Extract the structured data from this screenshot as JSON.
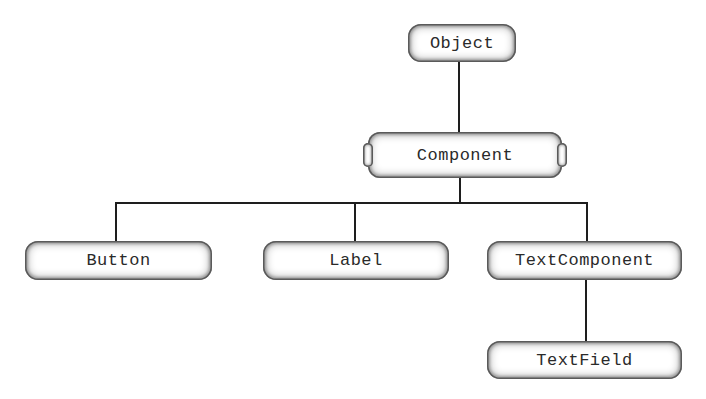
{
  "diagram": {
    "type": "class-hierarchy",
    "nodes": {
      "object": {
        "label": "Object",
        "abstract": false
      },
      "component": {
        "label": "Component",
        "abstract": true
      },
      "button": {
        "label": "Button",
        "abstract": false
      },
      "label": {
        "label": "Label",
        "abstract": false
      },
      "text_component": {
        "label": "TextComponent",
        "abstract": false
      },
      "text_field": {
        "label": "TextField",
        "abstract": false
      }
    },
    "edges": [
      {
        "from": "Object",
        "to": "Component"
      },
      {
        "from": "Component",
        "to": "Button"
      },
      {
        "from": "Component",
        "to": "Label"
      },
      {
        "from": "Component",
        "to": "TextComponent"
      },
      {
        "from": "TextComponent",
        "to": "TextField"
      }
    ]
  }
}
